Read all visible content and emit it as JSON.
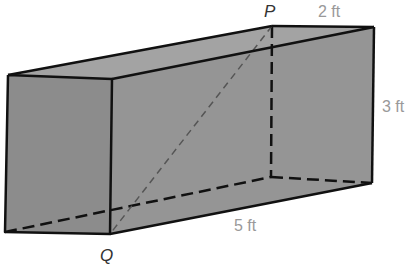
{
  "diagram": {
    "type": "rectangular-prism",
    "colors": {
      "face_fill": "#8f8f8f",
      "top_fill": "#a3a3a3",
      "edge": "#111111",
      "diagonal": "#555555",
      "vertex_label": "#333333",
      "dimension_label": "#999999"
    },
    "vertices": {
      "P": "P",
      "Q": "Q"
    },
    "dimensions": {
      "width": "2 ft",
      "height": "3 ft",
      "length": "5 ft"
    }
  }
}
